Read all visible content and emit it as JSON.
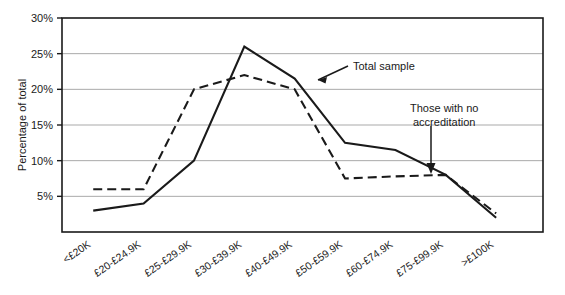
{
  "chart_data": {
    "type": "line",
    "title": "",
    "xlabel": "",
    "ylabel": "Percentage of total",
    "ylim": [
      0,
      30
    ],
    "yticks": [
      "5%",
      "10%",
      "15%",
      "20%",
      "25%",
      "30%"
    ],
    "ytick_values": [
      5,
      10,
      15,
      20,
      25,
      30
    ],
    "grid": true,
    "legend": "annotations",
    "categories": [
      "<£20K",
      "£20-£24.9K",
      "£25-£29.9K",
      "£30-£39.9K",
      "£40-£49.9K",
      "£50-£59.9K",
      "£60-£74.9K",
      "£75-£99.9K",
      ">£100K"
    ],
    "series": [
      {
        "name": "Total sample",
        "style": "solid",
        "color": "#1a1a1a",
        "values": [
          3,
          4,
          10,
          26,
          21.5,
          12.5,
          11.5,
          8,
          2
        ]
      },
      {
        "name": "Those with no accreditation",
        "style": "dashed",
        "color": "#1a1a1a",
        "values": [
          6,
          6,
          20,
          22,
          20,
          7.5,
          7.8,
          8,
          2.6
        ]
      }
    ],
    "annotations": [
      {
        "text": "Total sample",
        "target_series": "Total sample"
      },
      {
        "text_line1": "Those with no",
        "text_line2": "accreditation",
        "target_series": "Those with no accreditation"
      }
    ]
  },
  "axis": {
    "y_title": "Percentage of total"
  },
  "annotations": {
    "total_sample": "Total sample",
    "no_accreditation_line1": "Those with no",
    "no_accreditation_line2": "accreditation"
  }
}
